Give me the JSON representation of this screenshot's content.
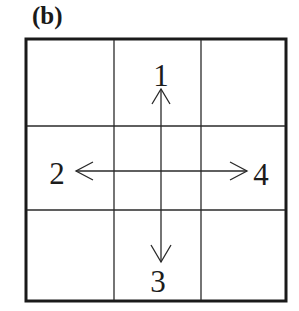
{
  "figure": {
    "panel_label": "(b)",
    "grid": {
      "rows": 3,
      "cols": 3,
      "outer_border_color": "#1a1a1a",
      "inner_line_color": "#2a2a2a"
    },
    "arrows": [
      {
        "id": 1,
        "direction": "up",
        "label": "1"
      },
      {
        "id": 2,
        "direction": "left",
        "label": "2"
      },
      {
        "id": 3,
        "direction": "down",
        "label": "3"
      },
      {
        "id": 4,
        "direction": "right",
        "label": "4"
      }
    ]
  }
}
